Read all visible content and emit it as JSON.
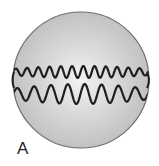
{
  "figure": {
    "panel_label": "A",
    "colors": {
      "sphere_fill_center": "#f2f2f2",
      "sphere_fill_edge": "#bdbdbd",
      "sphere_outline": "#6e6e6e",
      "strand": "#1e1e1e"
    },
    "strands": [
      {
        "name": "upper-strand",
        "waves": 12
      },
      {
        "name": "lower-strand",
        "waves": 8
      }
    ]
  }
}
